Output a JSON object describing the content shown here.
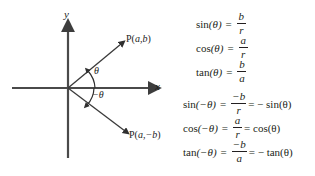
{
  "figure": {
    "axes": {
      "y_label": "y",
      "x_label": "x"
    },
    "angles": {
      "positive": "θ",
      "negative": "−θ"
    },
    "points": [
      {
        "name": "point-upper",
        "label_prefix": "P(",
        "label_x": "a",
        "label_sep": ",",
        "label_y": "b",
        "label_suffix": ")"
      },
      {
        "name": "point-lower",
        "label_prefix": "P(",
        "label_x": "a",
        "label_sep": ",",
        "label_y": "−b",
        "label_suffix": ")"
      }
    ],
    "colors": {
      "axis": "#4a4a4a",
      "ray": "#3a3a3a",
      "text": "#231f20",
      "background": "#ffffff"
    }
  },
  "equations": {
    "basic": [
      {
        "function": "sin",
        "argument": "(θ)",
        "numerator": "b",
        "denominator": "r",
        "tail": ""
      },
      {
        "function": "cos",
        "argument": "(θ)",
        "numerator": "a",
        "denominator": "r",
        "tail": ""
      },
      {
        "function": "tan",
        "argument": "(θ)",
        "numerator": "b",
        "denominator": "a",
        "tail": ""
      }
    ],
    "negative": [
      {
        "function": "sin",
        "argument": "(−θ)",
        "numerator": "−b",
        "denominator": "r",
        "tail": "= − sin(θ)"
      },
      {
        "function": "cos",
        "argument": "(−θ)",
        "numerator": "a",
        "denominator": "r",
        "tail": "= cos(θ)"
      },
      {
        "function": "tan",
        "argument": "(−θ)",
        "numerator": "−b",
        "denominator": "a",
        "tail": "= − tan(θ)"
      }
    ],
    "equals": "="
  }
}
